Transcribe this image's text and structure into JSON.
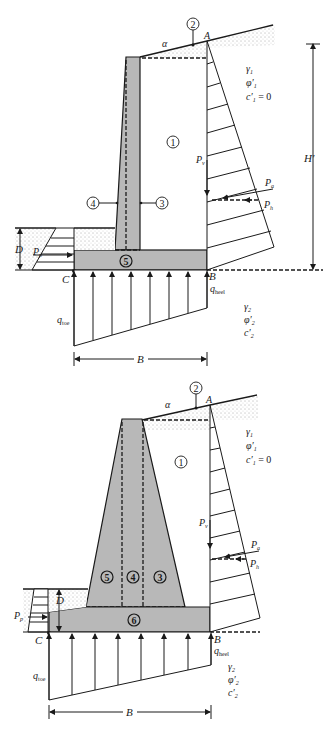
{
  "figure": {
    "colors": {
      "concrete": "#b8b8b8",
      "line": "#1a1a1a",
      "background": "#ffffff"
    }
  },
  "top_diagram": {
    "type": "cantilever-retaining-wall",
    "labels": {
      "alpha": "α",
      "A": "A",
      "B": "B",
      "C": "C",
      "H_prime": "H′",
      "D": "D",
      "B_width": "B",
      "Pa": "P",
      "Pa_sub": "a",
      "Pv": "P",
      "Pv_sub": "v",
      "Ph": "P",
      "Ph_sub": "h",
      "Pp": "P",
      "Pp_sub": "p",
      "q_toe": "q",
      "q_toe_sub": "toe",
      "q_heel": "q",
      "q_heel_sub": "heel"
    },
    "soil1": {
      "gamma": "γ",
      "gamma_sub": "1",
      "phi": "φ′",
      "phi_sub": "1",
      "c": "c′",
      "c_sub": "1",
      "c_val": " = 0"
    },
    "soil2": {
      "gamma": "γ",
      "gamma_sub": "2",
      "phi": "φ′",
      "phi_sub": "2",
      "c": "c′",
      "c_sub": "2"
    },
    "regions": [
      "1",
      "2",
      "3",
      "4",
      "5"
    ]
  },
  "bottom_diagram": {
    "type": "gravity-retaining-wall",
    "labels": {
      "alpha": "α",
      "A": "A",
      "B": "B",
      "C": "C",
      "D": "D",
      "B_width": "B",
      "Pa": "P",
      "Pa_sub": "a",
      "Pv": "P",
      "Pv_sub": "v",
      "Ph": "P",
      "Ph_sub": "h",
      "Pp": "P",
      "Pp_sub": "p",
      "q_toe": "q",
      "q_toe_sub": "toe",
      "q_heel": "q",
      "q_heel_sub": "heel"
    },
    "soil1": {
      "gamma": "γ",
      "gamma_sub": "1",
      "phi": "φ′",
      "phi_sub": "1",
      "c": "c′",
      "c_sub": "1",
      "c_val": " = 0"
    },
    "soil2": {
      "gamma": "γ",
      "gamma_sub": "2",
      "phi": "φ′",
      "phi_sub": "2",
      "c": "c′",
      "c_sub": "2"
    },
    "regions": [
      "1",
      "2",
      "3",
      "4",
      "5",
      "6"
    ]
  }
}
